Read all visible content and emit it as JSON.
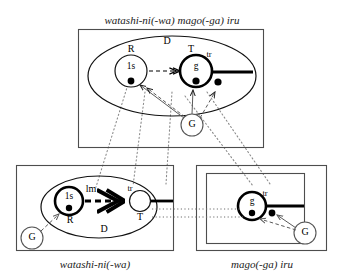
{
  "figure": {
    "title_top": "watashi-ni(-wa) mago(-ga) iru",
    "caption_bottom_left": "watashi-ni(-wa)",
    "caption_bottom_right": "mago(-ga) iru",
    "colors": {
      "ink": "#000000",
      "box_stroke": "#4d4d4d",
      "correspondence": "#8c8c8c",
      "ground_stroke": "#555555"
    }
  },
  "top_box": {
    "name": "composite-structure",
    "domain_label": "D",
    "reference_label": "R",
    "trajector_label": "tr",
    "target_label": "T",
    "ground_label": "G",
    "reference_entity": "1s",
    "target_entity": "g"
  },
  "bottom_left_box": {
    "name": "watashi-ni-wa-component",
    "domain_label": "D",
    "reference_label": "R",
    "landmark_label": "lm",
    "trajector_label": "tr",
    "target_label": "T",
    "ground_label": "G",
    "reference_entity": "1s"
  },
  "bottom_right_box": {
    "name": "mago-ga-iru-component",
    "trajector_label": "tr",
    "ground_label": "G",
    "target_entity": "g"
  }
}
